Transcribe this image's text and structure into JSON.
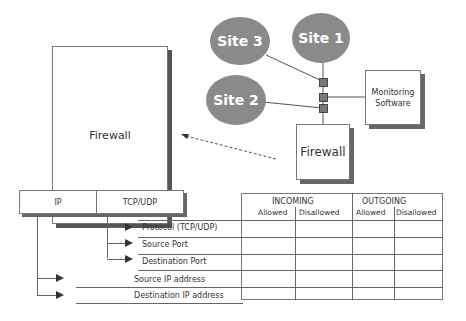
{
  "large_firewall": {
    "label": "Firewall"
  },
  "network": {
    "sites": [
      {
        "label": "Site 3"
      },
      {
        "label": "Site 1"
      },
      {
        "label": "Site 2"
      }
    ],
    "monitoring": {
      "label_line1": "Monitoring",
      "label_line2": "Software"
    },
    "firewall": {
      "label": "Firewall"
    }
  },
  "packet_header": {
    "fields": [
      {
        "label": "IP"
      },
      {
        "label": "TCP/UDP"
      }
    ]
  },
  "rule_table": {
    "groups": [
      {
        "label": "INCOMING",
        "columns": [
          "Allowed",
          "Disallowed"
        ]
      },
      {
        "label": "OUTGOING",
        "columns": [
          "Allowed",
          "Disallowed"
        ]
      }
    ],
    "rows": [
      {
        "label": "Protocol (TCP/UDP)",
        "source": "TCP/UDP"
      },
      {
        "label": "Source Port",
        "source": "TCP/UDP"
      },
      {
        "label": "Destination Port",
        "source": "TCP/UDP"
      },
      {
        "label": "Source IP address",
        "source": "IP"
      },
      {
        "label": "Destination IP address",
        "source": "IP"
      }
    ]
  }
}
